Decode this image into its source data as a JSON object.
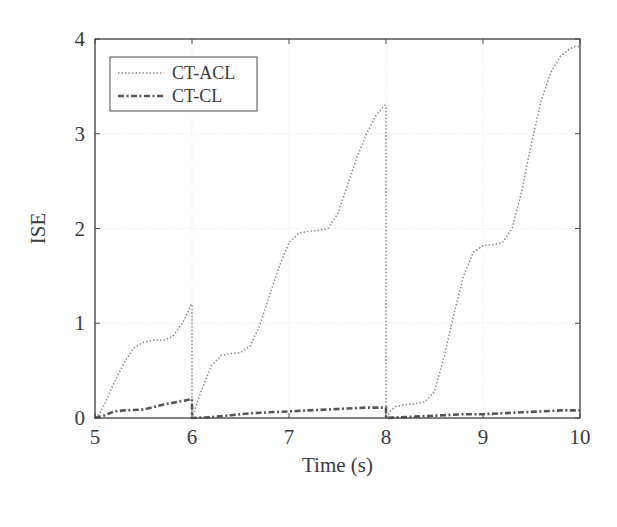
{
  "chart_data": {
    "type": "line",
    "title": "",
    "xlabel": "Time (s)",
    "ylabel": "ISE",
    "xlim": [
      5,
      10
    ],
    "ylim": [
      0,
      4
    ],
    "xticks": [
      5,
      6,
      7,
      8,
      9,
      10
    ],
    "yticks": [
      0,
      1,
      2,
      3,
      4
    ],
    "grid": true,
    "legend_position": "upper left",
    "series": [
      {
        "name": "CT-ACL",
        "style": "dotted",
        "color": "#8a8a8a",
        "x": [
          5.0,
          5.05,
          5.1,
          5.2,
          5.3,
          5.4,
          5.5,
          5.6,
          5.7,
          5.8,
          5.9,
          5.95,
          5.99,
          6.0,
          6.0,
          6.05,
          6.1,
          6.2,
          6.3,
          6.4,
          6.5,
          6.6,
          6.7,
          6.8,
          6.9,
          7.0,
          7.1,
          7.2,
          7.3,
          7.4,
          7.5,
          7.6,
          7.7,
          7.8,
          7.9,
          7.99,
          8.0,
          8.0,
          8.05,
          8.1,
          8.2,
          8.3,
          8.4,
          8.5,
          8.6,
          8.7,
          8.8,
          8.9,
          9.0,
          9.1,
          9.2,
          9.3,
          9.4,
          9.5,
          9.6,
          9.7,
          9.8,
          9.9,
          9.95,
          10.0
        ],
        "y": [
          0.0,
          0.05,
          0.15,
          0.38,
          0.58,
          0.74,
          0.8,
          0.82,
          0.82,
          0.86,
          1.0,
          1.1,
          1.2,
          1.2,
          0.0,
          0.15,
          0.3,
          0.55,
          0.66,
          0.68,
          0.69,
          0.76,
          0.98,
          1.3,
          1.6,
          1.85,
          1.95,
          1.97,
          1.98,
          2.0,
          2.15,
          2.45,
          2.75,
          3.0,
          3.2,
          3.3,
          3.3,
          0.0,
          0.08,
          0.12,
          0.14,
          0.15,
          0.17,
          0.28,
          0.65,
          1.1,
          1.5,
          1.75,
          1.82,
          1.83,
          1.85,
          2.0,
          2.4,
          2.9,
          3.35,
          3.65,
          3.82,
          3.9,
          3.92,
          3.92
        ]
      },
      {
        "name": "CT-CL",
        "style": "dash-dot",
        "color": "#555555",
        "x": [
          5.0,
          5.1,
          5.2,
          5.3,
          5.5,
          5.7,
          5.85,
          6.0,
          6.0,
          6.0,
          6.2,
          6.4,
          6.6,
          6.8,
          7.0,
          7.2,
          7.4,
          7.6,
          7.8,
          8.0,
          8.0,
          8.0,
          8.2,
          8.4,
          8.6,
          8.8,
          9.0,
          9.2,
          9.4,
          9.6,
          9.8,
          10.0
        ],
        "y": [
          0.0,
          0.03,
          0.07,
          0.08,
          0.09,
          0.14,
          0.17,
          0.2,
          0.0,
          0.0,
          0.01,
          0.03,
          0.05,
          0.06,
          0.07,
          0.08,
          0.09,
          0.1,
          0.11,
          0.11,
          0.0,
          0.0,
          0.01,
          0.02,
          0.03,
          0.04,
          0.04,
          0.05,
          0.06,
          0.07,
          0.08,
          0.08
        ]
      }
    ]
  },
  "legend": {
    "items": [
      {
        "label": "CT-ACL"
      },
      {
        "label": "CT-CL"
      }
    ]
  },
  "axes": {
    "xlabel": "Time (s)",
    "ylabel": "ISE",
    "xtick_labels": [
      "5",
      "6",
      "7",
      "8",
      "9",
      "10"
    ],
    "ytick_labels": [
      "0",
      "1",
      "2",
      "3",
      "4"
    ]
  }
}
